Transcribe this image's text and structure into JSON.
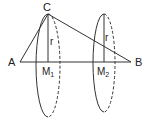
{
  "figure": {
    "points": {
      "A": {
        "label": "A",
        "x": 20,
        "y": 62
      },
      "B": {
        "label": "B",
        "x": 131,
        "y": 62
      },
      "C": {
        "label": "C",
        "x": 48,
        "y": 14
      },
      "M1": {
        "label": "M",
        "sub": "1",
        "x": 48,
        "y": 62
      },
      "M2": {
        "label": "M",
        "sub": "2",
        "x": 104,
        "y": 62
      }
    },
    "radius_labels": [
      {
        "text": "r",
        "x": 50,
        "y": 44
      },
      {
        "text": "r",
        "x": 105,
        "y": 40
      }
    ],
    "circles": [
      {
        "name": "circle-m1",
        "cx": 48,
        "cy": 65,
        "rx": 12,
        "ry": 52
      },
      {
        "name": "circle-m2",
        "cx": 104,
        "cy": 62,
        "rx": 11,
        "ry": 49
      }
    ],
    "stroke_color": "#333333"
  }
}
